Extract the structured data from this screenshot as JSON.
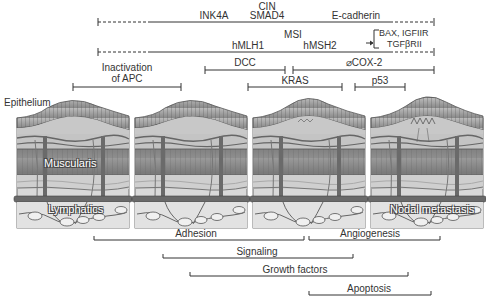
{
  "figure": {
    "top_genes": {
      "cin_label": "CIN",
      "cin_genes": [
        "INK4A",
        "SMAD4",
        "E-cadherin"
      ],
      "msi_label": "MSI",
      "msi_genes": [
        "hMLH1",
        "hMSH2"
      ],
      "msi_targets": [
        "BAX, IGFIIR",
        "TGFβRII"
      ]
    },
    "stage_brackets": {
      "apc": "Inactivation of APC",
      "apc_line1": "Inactivation",
      "apc_line2": "of APC",
      "dcc": "DCC",
      "cox2": "⌀COX-2",
      "kras": "KRAS",
      "p53": "p53"
    },
    "tissue_labels": {
      "epithelium": "Epithelium",
      "muscularis": "Muscularis",
      "lymphatics": "Lymphatics",
      "nodal_metastasis": "Nodal metastasis"
    },
    "process_brackets": [
      "Adhesion",
      "Angiogenesis",
      "Signaling",
      "Growth factors",
      "Apoptosis"
    ],
    "colors": {
      "line": "#333333",
      "tissue_dark": "#6f6f6f",
      "tissue_mid": "#9a9a9a",
      "tissue_light": "#c8c8c8",
      "tissue_pale": "#dedede"
    }
  }
}
